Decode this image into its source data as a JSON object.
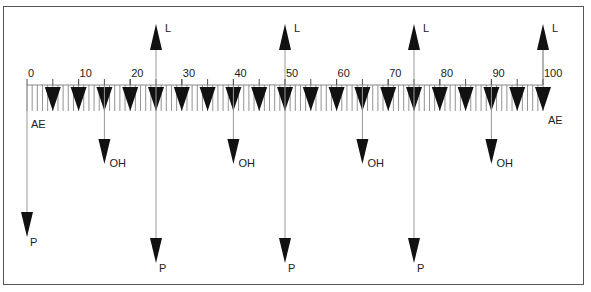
{
  "diagram": {
    "scale": {
      "min": 0,
      "max": 100,
      "labels": [
        "0",
        "10",
        "20",
        "30",
        "40",
        "50",
        "60",
        "70",
        "80",
        "90",
        "100"
      ],
      "label_values": [
        0,
        10,
        20,
        30,
        40,
        50,
        60,
        70,
        80,
        90,
        100
      ],
      "minor_tick_step": 1,
      "arrow_step": 5
    },
    "end_labels": {
      "left": "AE",
      "right": "AE"
    },
    "up_arrows": {
      "label": "L",
      "positions": [
        25,
        50,
        75,
        100
      ]
    },
    "oh_arrows": {
      "label": "OH",
      "positions": [
        15,
        40,
        65,
        90
      ]
    },
    "p_arrows": {
      "label": "P",
      "positions": [
        0,
        25,
        50,
        75
      ]
    },
    "colors": {
      "arrow": "#111111",
      "line": "#999999",
      "tick": "#777777",
      "frame": "#555555"
    }
  }
}
